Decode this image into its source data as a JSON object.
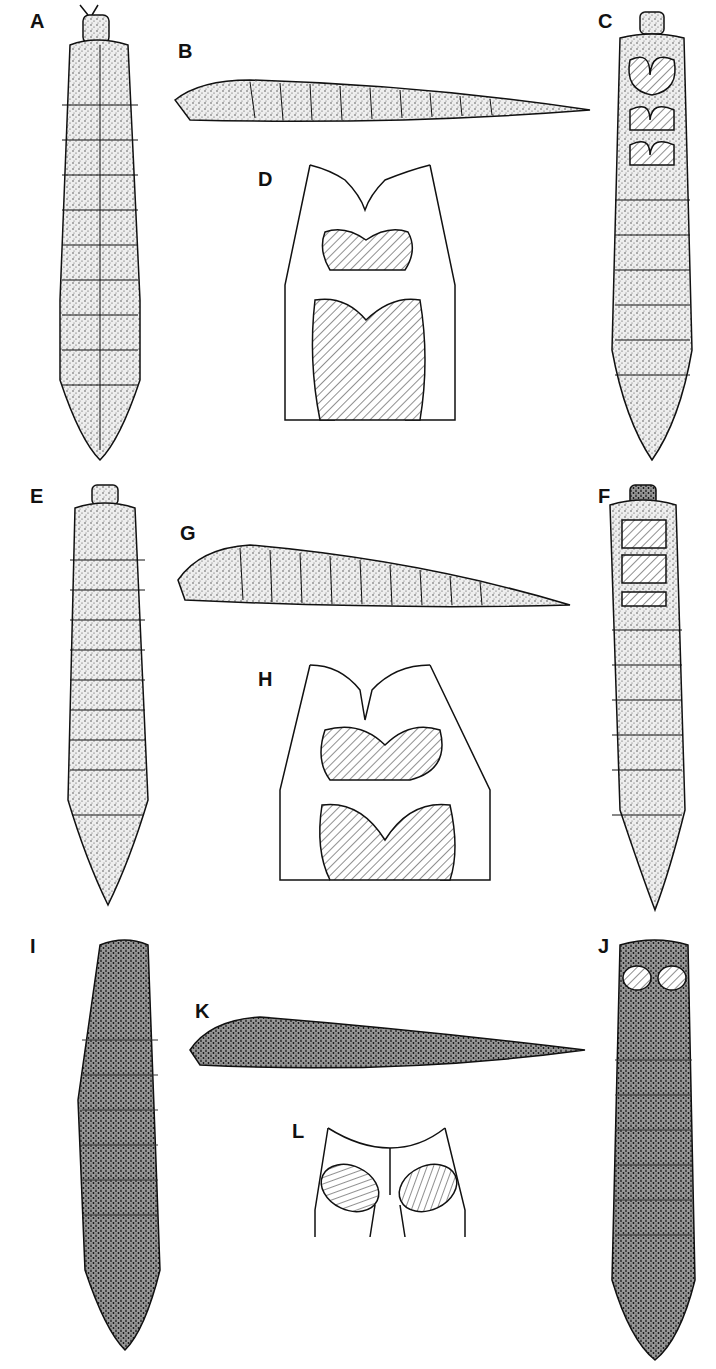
{
  "figure": {
    "panels": [
      {
        "id": "A",
        "label": "A",
        "view": "dorsal larva, light stipple"
      },
      {
        "id": "B",
        "label": "B",
        "view": "lateral larva, light stipple"
      },
      {
        "id": "C",
        "label": "C",
        "view": "ventral larva with hatched plates"
      },
      {
        "id": "D",
        "label": "D",
        "view": "detail of ventral thoracic plates"
      },
      {
        "id": "E",
        "label": "E",
        "view": "dorsal larva, setose"
      },
      {
        "id": "F",
        "label": "F",
        "view": "ventral larva, setose, hatched plates"
      },
      {
        "id": "G",
        "label": "G",
        "view": "lateral larva, setose"
      },
      {
        "id": "H",
        "label": "H",
        "view": "detail of ventral thoracic plates"
      },
      {
        "id": "I",
        "label": "I",
        "view": "dorsal larva, dark stipple"
      },
      {
        "id": "J",
        "label": "J",
        "view": "ventral larva, dark, oval plates"
      },
      {
        "id": "K",
        "label": "K",
        "view": "lateral larva, dark stipple"
      },
      {
        "id": "L",
        "label": "L",
        "view": "detail of oval ventral plates"
      }
    ]
  }
}
